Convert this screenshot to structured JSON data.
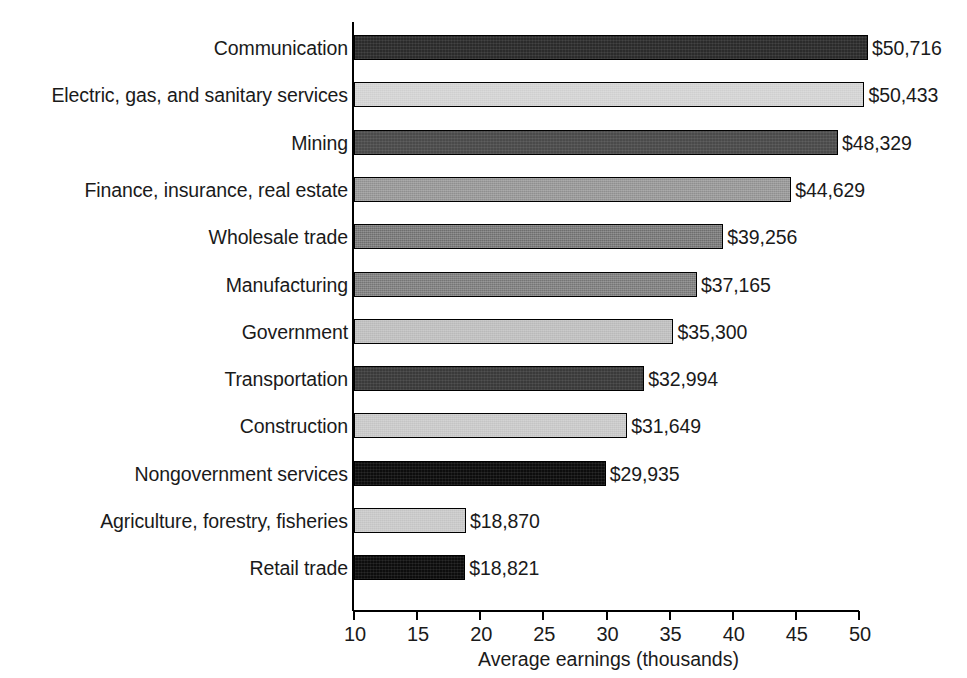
{
  "chart_data": {
    "type": "bar",
    "orientation": "horizontal",
    "title": "",
    "xlabel": "Average earnings (thousands)",
    "ylabel": "",
    "xlim": [
      10,
      50
    ],
    "xticks": [
      "10",
      "15",
      "20",
      "25",
      "30",
      "35",
      "40",
      "45",
      "50"
    ],
    "xtick_values": [
      10,
      15,
      20,
      25,
      30,
      35,
      40,
      45,
      50
    ],
    "grid": false,
    "legend": null,
    "categories": [
      "Communication",
      "Electric, gas, and sanitary services",
      "Mining",
      "Finance, insurance, real estate",
      "Wholesale trade",
      "Manufacturing",
      "Government",
      "Transportation",
      "Construction",
      "Nongovernment services",
      "Agriculture, forestry, fisheries",
      "Retail trade"
    ],
    "values": [
      50716,
      50433,
      48329,
      44629,
      39256,
      37165,
      35300,
      32994,
      31649,
      29935,
      18870,
      18821
    ],
    "value_labels": [
      "$50,716",
      "$50,433",
      "$48,329",
      "$44,629",
      "$39,256",
      "$37,165",
      "$35,300",
      "$32,994",
      "$31,649",
      "$29,935",
      "$18,870",
      "$18,821"
    ],
    "bar_fills": [
      "#2b2b2b",
      "#cfcfcf",
      "#4a4a4a",
      "#8f8f8f",
      "#6e6e6e",
      "#757575",
      "#b9b9b9",
      "#3a3a3a",
      "#c4c4c4",
      "#0d0d0d",
      "#c4c4c4",
      "#0d0d0d"
    ],
    "bar_edge_color": "#000000",
    "axis_color": "#000000",
    "background": "#ffffff",
    "text_color": "#1a1a1a"
  },
  "bars": [
    {
      "label": "Communication",
      "value_label": "$50,716",
      "value": 50716,
      "fill_class": "fill-vdark",
      "texture": "dither-dark"
    },
    {
      "label": "Electric, gas, and sanitary services",
      "value_label": "$50,433",
      "value": 50433,
      "fill_class": "fill-vlight",
      "texture": "dither"
    },
    {
      "label": "Mining",
      "value_label": "$48,329",
      "value": 48329,
      "fill_class": "fill-darkgray",
      "texture": "dither-dark"
    },
    {
      "label": "Finance, insurance, real estate",
      "value_label": "$44,629",
      "value": 44629,
      "fill_class": "fill-gray",
      "texture": "dither"
    },
    {
      "label": "Wholesale trade",
      "value_label": "$39,256",
      "value": 39256,
      "fill_class": "fill-midgray",
      "texture": "dither"
    },
    {
      "label": "Manufacturing",
      "value_label": "$37,165",
      "value": 37165,
      "fill_class": "fill-midgray2",
      "texture": "dither"
    },
    {
      "label": "Government",
      "value_label": "$35,300",
      "value": 35300,
      "fill_class": "fill-lightgray",
      "texture": "dither"
    },
    {
      "label": "Transportation",
      "value_label": "$32,994",
      "value": 32994,
      "fill_class": "fill-dark",
      "texture": "dither-dark"
    },
    {
      "label": "Construction",
      "value_label": "$31,649",
      "value": 31649,
      "fill_class": "fill-lightgray2",
      "texture": "dither"
    },
    {
      "label": "Nongovernment services",
      "value_label": "$29,935",
      "value": 29935,
      "fill_class": "fill-black",
      "texture": "dither-dark"
    },
    {
      "label": "Agriculture, forestry, fisheries",
      "value_label": "$18,870",
      "value": 18870,
      "fill_class": "fill-lightgray2",
      "texture": "dither"
    },
    {
      "label": "Retail trade",
      "value_label": "$18,821",
      "value": 18821,
      "fill_class": "fill-black",
      "texture": "dither-dark"
    }
  ],
  "axis": {
    "x_title": "Average earnings (thousands)",
    "ticks": [
      "10",
      "15",
      "20",
      "25",
      "30",
      "35",
      "40",
      "45",
      "50"
    ]
  }
}
